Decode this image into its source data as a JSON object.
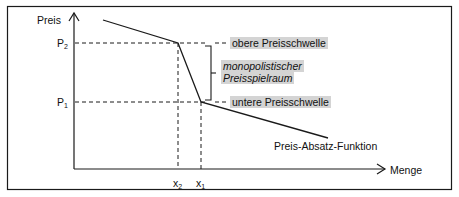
{
  "diagram": {
    "y_axis_label": "Preis",
    "x_axis_label": "Menge",
    "price_levels": [
      {
        "label": "P",
        "sub": "2"
      },
      {
        "label": "P",
        "sub": "1"
      }
    ],
    "quantity_levels": [
      {
        "label": "x",
        "sub": "2"
      },
      {
        "label": "x",
        "sub": "1"
      }
    ],
    "annotations": {
      "upper_threshold": "obere Preisschwelle",
      "range_line1": "monopolistischer",
      "range_line2": "Preisspielraum",
      "lower_threshold": "untere Preisschwelle",
      "curve_label": "Preis-Absatz-Funktion"
    },
    "colors": {
      "line": "#1a1a1a",
      "highlight": "#d4d4d4"
    }
  }
}
